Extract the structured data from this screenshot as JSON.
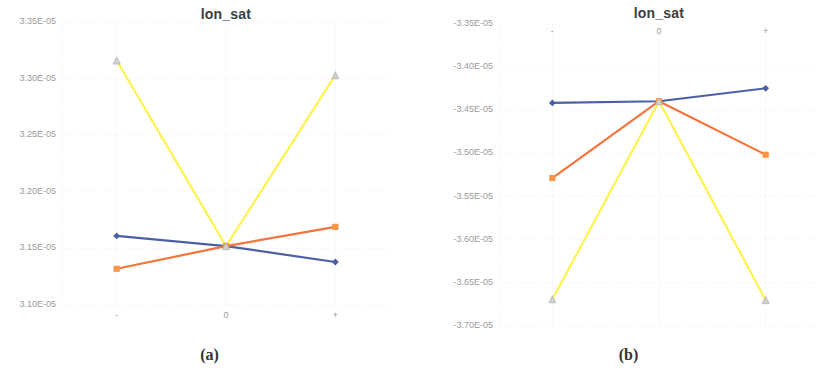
{
  "figure": {
    "panels": [
      {
        "caption": "(a)",
        "title": "Ion_sat",
        "title_display": "lon_sat",
        "xticks": [
          "-",
          "0",
          "+"
        ],
        "xticks_position": "bottom",
        "yticks": [
          "3.35E-05",
          "3.30E-05",
          "3.25E-05",
          "3.20E-05",
          "3.15E-05",
          "3.10E-05"
        ]
      },
      {
        "caption": "(b)",
        "title": "Ion_sat",
        "title_display": "lon_sat",
        "xticks": [
          "-",
          "0",
          "+"
        ],
        "xticks_position": "top",
        "yticks": [
          "-3.35E-05",
          "-3.40E-05",
          "-3.45E-05",
          "-3.50E-05",
          "-3.55E-05",
          "-3.60E-05",
          "-3.65E-05",
          "-3.70E-05"
        ]
      }
    ]
  },
  "colors": {
    "blue": "#4A5FA5",
    "orange": "#F4743B",
    "yellow": "#FFF34D",
    "grid": "#E9E9E9",
    "tick_text": "#9B9B9B",
    "title_text": "#3D3D3D",
    "caption_text": "#333333"
  },
  "chart_data": [
    {
      "type": "line",
      "panel": "(a)",
      "title": "Ion_sat",
      "xlabel": "",
      "ylabel": "",
      "categories": [
        "-",
        "0",
        "+"
      ],
      "ylim": [
        3.1e-05,
        3.35e-05
      ],
      "yticks": [
        3.35e-05,
        3.3e-05,
        3.25e-05,
        3.2e-05,
        3.15e-05,
        3.1e-05
      ],
      "grid": true,
      "legend": "none",
      "series": [
        {
          "name": "Series 1",
          "color": "#4A5FA5",
          "marker": "diamond",
          "values": [
            3.161e-05,
            3.152e-05,
            3.138e-05
          ]
        },
        {
          "name": "Series 2",
          "color": "#F4743B",
          "marker": "square",
          "values": [
            3.132e-05,
            3.152e-05,
            3.169e-05
          ]
        },
        {
          "name": "Series 3",
          "color": "#FFF34D",
          "marker": "triangle",
          "values": [
            3.316e-05,
            3.152e-05,
            3.303e-05
          ]
        }
      ]
    },
    {
      "type": "line",
      "panel": "(b)",
      "title": "Ion_sat",
      "xlabel": "",
      "ylabel": "",
      "categories": [
        "-",
        "0",
        "+"
      ],
      "ylim": [
        -3.7e-05,
        -3.35e-05
      ],
      "yticks": [
        -3.35e-05,
        -3.4e-05,
        -3.45e-05,
        -3.5e-05,
        -3.55e-05,
        -3.6e-05,
        -3.65e-05,
        -3.7e-05
      ],
      "grid": true,
      "legend": "none",
      "series": [
        {
          "name": "Series 1",
          "color": "#4A5FA5",
          "marker": "diamond",
          "values": [
            -3.4415e-05,
            -3.4395e-05,
            -3.4245e-05
          ]
        },
        {
          "name": "Series 2",
          "color": "#F4743B",
          "marker": "square",
          "values": [
            -3.5285e-05,
            -3.4395e-05,
            -3.5015e-05
          ]
        },
        {
          "name": "Series 3",
          "color": "#FFF34D",
          "marker": "triangle",
          "values": [
            -3.669e-05,
            -3.4395e-05,
            -3.67e-05
          ]
        }
      ]
    }
  ]
}
